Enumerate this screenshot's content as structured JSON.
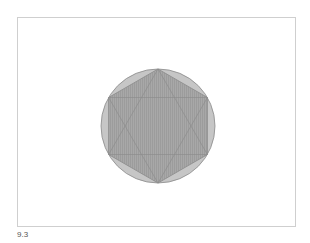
{
  "figure": {
    "caption": "9.3",
    "shapes": {
      "circle": {
        "cx": 158,
        "cy": 126,
        "r": 57,
        "fill": "#c4c4c4",
        "stroke": "#8a8a8a"
      },
      "hexagon": {
        "fill": "#a6a6a6",
        "stroke": "#8a8a8a"
      },
      "star": {
        "stroke": "#8f8f8f"
      }
    }
  }
}
